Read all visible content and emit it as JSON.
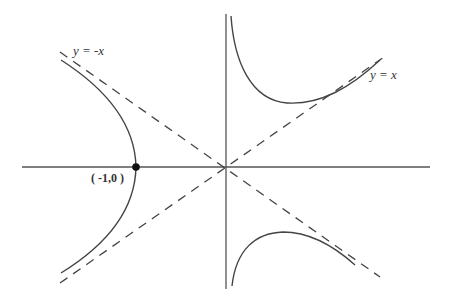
{
  "figure": {
    "type": "hyperbola-diagram",
    "colors": {
      "background": "#ffffff",
      "axis": "#555555",
      "curve": "#444444",
      "asymptote": "#444444",
      "point": "#111111"
    },
    "asymptotes": [
      {
        "label": "y = -x",
        "style": "dashed"
      },
      {
        "label": "y = x",
        "style": "dashed"
      }
    ],
    "labeled_point": {
      "label": "( -1,0 )",
      "x": -1,
      "y": 0
    }
  }
}
